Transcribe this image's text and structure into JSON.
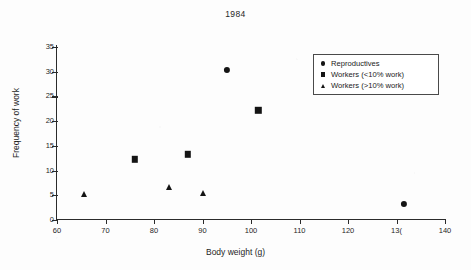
{
  "chart_data": {
    "type": "scatter",
    "title": "1984",
    "xlabel": "Body weight (g)",
    "ylabel": "Frequency of work",
    "xlim": [
      60,
      140
    ],
    "ylim": [
      0,
      35
    ],
    "xticks": [
      60,
      70,
      80,
      90,
      100,
      110,
      120,
      130,
      140
    ],
    "xtick_labels": [
      "60",
      "70",
      "80",
      "90",
      "100",
      "110",
      "120",
      "13(",
      "140"
    ],
    "yticks": [
      0,
      5,
      10,
      15,
      20,
      25,
      30,
      35
    ],
    "ytick_labels": [
      "0",
      "5",
      "10",
      "15",
      "20",
      "25",
      "30",
      "35"
    ],
    "grid": false,
    "legend_position": "top-right",
    "series": [
      {
        "name": "Reproductives",
        "marker": "circle",
        "points": [
          {
            "x": 95.0,
            "y": 30.4
          },
          {
            "x": 131.5,
            "y": 3.2
          }
        ]
      },
      {
        "name": "Workers (<10% work)",
        "marker": "square",
        "points": [
          {
            "x": 76.0,
            "y": 12.3
          },
          {
            "x": 87.0,
            "y": 13.3
          },
          {
            "x": 101.5,
            "y": 22.2
          }
        ]
      },
      {
        "name": "Workers (>10% work)",
        "marker": "triangle",
        "points": [
          {
            "x": 65.5,
            "y": 5.3
          },
          {
            "x": 83.0,
            "y": 6.6
          },
          {
            "x": 90.0,
            "y": 5.4
          }
        ]
      }
    ]
  },
  "colors": {
    "marker": "#141414",
    "axis": "#2b2b2b",
    "text": "#1f1f1f",
    "background": "#fdfdfd",
    "legend_border": "#4a4a4a"
  }
}
